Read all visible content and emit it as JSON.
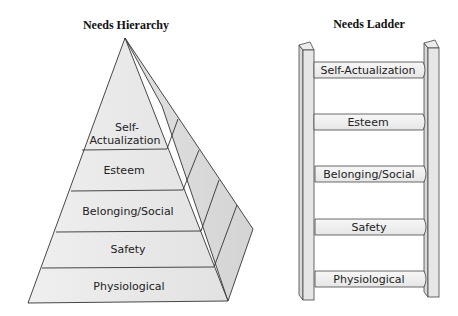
{
  "left_diagram": {
    "title": "Needs Hierarchy",
    "levels": [
      {
        "line1": "Self-",
        "line2": "Actualization"
      },
      {
        "label": "Esteem"
      },
      {
        "label": "Belonging/Social"
      },
      {
        "label": "Safety"
      },
      {
        "label": "Physiological"
      }
    ],
    "colors": {
      "front": "#ececec",
      "side": "#dcdcdc",
      "stroke": "#333333"
    }
  },
  "right_diagram": {
    "title": "Needs Ladder",
    "rungs": [
      {
        "label": "Self-Actualization"
      },
      {
        "label": "Esteem"
      },
      {
        "label": "Belonging/Social"
      },
      {
        "label": "Safety"
      },
      {
        "label": "Physiological"
      }
    ],
    "colors": {
      "rail": "#e4e4e4",
      "rung": "#efefef",
      "stroke": "#444444"
    }
  }
}
